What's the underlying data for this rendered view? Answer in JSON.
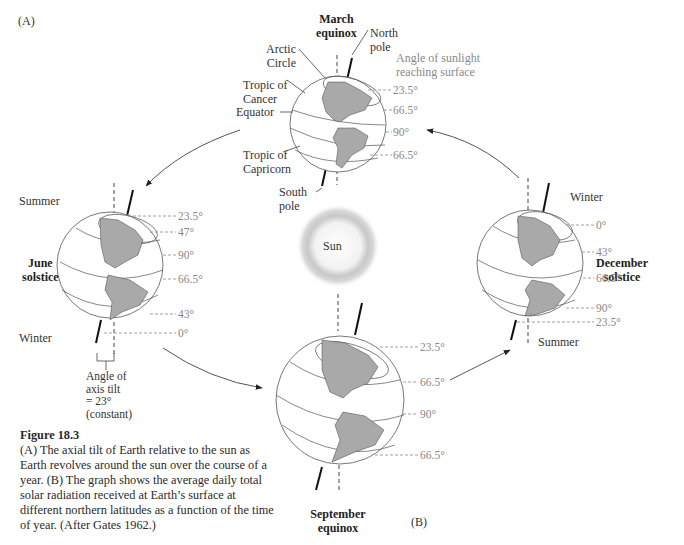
{
  "panel_labels": {
    "a": "(A)",
    "b": "(B)"
  },
  "sun": {
    "label": "Sun"
  },
  "march": {
    "title_line1": "March",
    "title_line2": "equinox",
    "labels": {
      "north_pole_1": "North",
      "north_pole_2": "pole",
      "arctic_1": "Arctic",
      "arctic_2": "Circle",
      "cancer_1": "Tropic of",
      "cancer_2": "Cancer",
      "equator": "Equator",
      "capricorn_1": "Tropic of",
      "capricorn_2": "Capricorn",
      "south_pole_1": "South",
      "south_pole_2": "pole",
      "sunlight_1": "Angle of sunlight",
      "sunlight_2": "reaching surface"
    },
    "angles": [
      "23.5°",
      "66.5°",
      "90°",
      "66.5°"
    ]
  },
  "june": {
    "title_line1": "June",
    "title_line2": "solstice",
    "summer": "Summer",
    "winter": "Winter",
    "angles": [
      "23.5°",
      "47°",
      "90°",
      "66.5°",
      "43°",
      "0°"
    ],
    "tilt_1": "Angle of",
    "tilt_2": "axis tilt",
    "tilt_3": "= 23°",
    "tilt_4": "(constant)"
  },
  "december": {
    "title_line1": "December",
    "title_line2": "solstice",
    "winter": "Winter",
    "summer": "Summer",
    "angles": [
      "0°",
      "43°",
      "66.5°",
      "90°",
      "23.5°"
    ]
  },
  "september": {
    "title_line1": "September",
    "title_line2": "equinox",
    "angles": [
      "23.5°",
      "66.5°",
      "90°",
      "66.5°"
    ]
  },
  "caption": {
    "title": "Figure 18.3",
    "text": "(A) The axial tilt of Earth relative to the sun as Earth revolves around the sun over the course of a year. (B) The graph shows the average daily total solar radiation received at Earth’s surface at different northern latitudes as a function of the time of year. (After Gates 1962.)"
  },
  "colors": {
    "land": "#a9a9a9",
    "line": "#444444",
    "angle_text": "#888888"
  }
}
